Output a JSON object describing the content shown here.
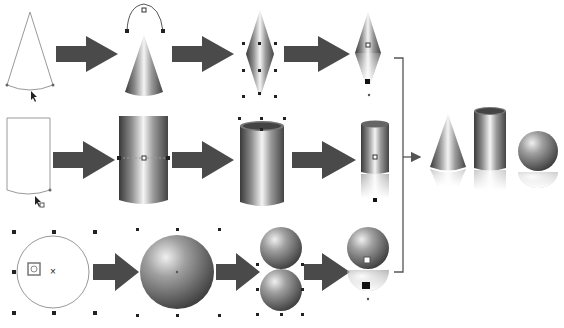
{
  "diagram": {
    "title": "",
    "rows": [
      {
        "shape": "cone",
        "steps": [
          "outline-path",
          "gradient-fill",
          "mirror-duplicate",
          "transparency-reflection"
        ]
      },
      {
        "shape": "cylinder",
        "steps": [
          "outline-path",
          "gradient-fill",
          "top-ellipse",
          "transparency-reflection"
        ]
      },
      {
        "shape": "sphere",
        "steps": [
          "circle-outline",
          "radial-fill",
          "mirror-duplicate",
          "transparency-reflection"
        ]
      }
    ],
    "result": [
      "cone",
      "cylinder",
      "sphere"
    ],
    "colors": {
      "arrow": "#4a4a4a",
      "bracket": "#555555",
      "shape_dark": "#3a3a3a",
      "shape_light": "#f2f2f2",
      "outline": "#8a8a8a"
    }
  }
}
